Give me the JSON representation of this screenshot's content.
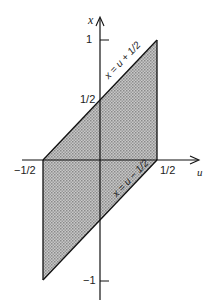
{
  "diagram": {
    "type": "region-plot",
    "axes": {
      "horizontal_label": "u",
      "vertical_label": "x"
    },
    "ticks": {
      "x_one": "1",
      "x_half": "1/2",
      "x_neg_one": "−1",
      "u_neg_half": "−1/2",
      "u_half": "1/2"
    },
    "lines": {
      "upper": "x = u + 1/2",
      "lower": "x = u − 1/2"
    },
    "region": {
      "description": "shaded parallelogram",
      "vertices_uv": [
        [
          -0.5,
          0
        ],
        [
          0.5,
          1
        ],
        [
          0.5,
          0
        ],
        [
          -0.5,
          -1
        ]
      ],
      "fill": "#b8b8b8",
      "stroke": "#111111"
    }
  }
}
